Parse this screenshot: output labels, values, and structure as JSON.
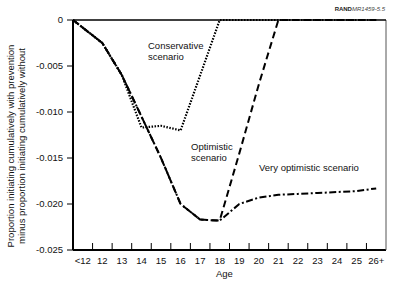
{
  "source_tag": {
    "org": "RAND",
    "id": "MR1459-5.5"
  },
  "chart_data": {
    "type": "line",
    "title": "",
    "xlabel": "Age",
    "ylabel_lines": [
      "Proportion initiating cumulatively with prevention",
      "minus proportion initiating cumulatively without"
    ],
    "ylim": [
      -0.025,
      0
    ],
    "yticks": [
      "0",
      "-0.005",
      "-0.010",
      "-0.015",
      "-0.020",
      "-0.025"
    ],
    "grid": false,
    "categories": [
      "<12",
      "12",
      "13",
      "14",
      "15",
      "16",
      "17",
      "18",
      "19",
      "20",
      "21",
      "22",
      "23",
      "24",
      "25",
      "26+"
    ],
    "series": [
      {
        "name": "Conservative scenario",
        "style": "dotted",
        "values": [
          0,
          -0.0025,
          -0.006,
          -0.0117,
          -0.0115,
          -0.012,
          -0.006,
          0,
          0,
          0,
          0,
          0,
          0,
          0,
          0,
          0
        ]
      },
      {
        "name": "Optimistic scenario",
        "style": "dashed",
        "values": [
          0,
          -0.0025,
          -0.006,
          -0.0105,
          -0.015,
          -0.02,
          -0.0217,
          -0.0218,
          -0.0145,
          -0.007,
          0,
          0,
          0,
          0,
          0,
          0
        ]
      },
      {
        "name": "Very optimistic scenario",
        "style": "dash-dot",
        "values": [
          0,
          -0.0025,
          -0.006,
          -0.0105,
          -0.015,
          -0.02,
          -0.0217,
          -0.0218,
          -0.02,
          -0.0193,
          -0.019,
          -0.0189,
          -0.0188,
          -0.0187,
          -0.0186,
          -0.0183
        ]
      }
    ],
    "annotations": [
      {
        "text_lines": [
          "Conservative",
          "scenario"
        ],
        "x": 148,
        "y": 40
      },
      {
        "text_lines": [
          "Optimistic",
          "scenario"
        ],
        "x": 191,
        "y": 141
      },
      {
        "text_lines": [
          "Very optimistic scenario"
        ],
        "x": 259,
        "y": 162
      }
    ]
  }
}
